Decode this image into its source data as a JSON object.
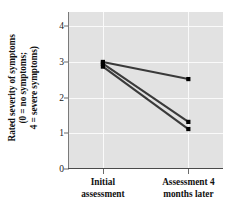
{
  "chart_data": {
    "type": "line",
    "title": "",
    "xlabel": "",
    "ylabel": "Rated severity of symptoms (0 = no symptoms; 4 = severe symptoms)",
    "ylabel_lines": [
      "Rated severity of symptoms",
      "(0 = no symptoms;",
      "4 = severe symptoms)"
    ],
    "categories": [
      "Initial assessment",
      "Assessment 4 months later"
    ],
    "category_lines": [
      [
        "Initial",
        "assessment"
      ],
      [
        "Assessment 4",
        "months later"
      ]
    ],
    "yticks": [
      "0",
      "1",
      "2",
      "3",
      "4"
    ],
    "ytick_values": [
      0,
      1,
      2,
      3,
      4
    ],
    "ylim": [
      0,
      4.4
    ],
    "grid": true,
    "grid_color": "#fafafa",
    "plot_background": "#e2e2e2",
    "legend": "none",
    "line_color": "#3a3a3a",
    "marker_color": "#000000",
    "series": [
      {
        "name": "Series 1",
        "values": [
          3.0,
          2.52
        ]
      },
      {
        "name": "Series 2",
        "values": [
          2.95,
          1.32
        ]
      },
      {
        "name": "Series 3",
        "values": [
          2.87,
          1.12
        ]
      }
    ]
  }
}
